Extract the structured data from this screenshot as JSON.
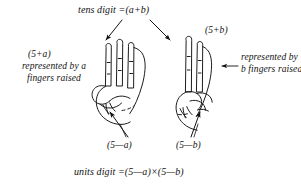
{
  "figure": {
    "background_color": "#ffffff",
    "ink_color": "#111111"
  },
  "labels": {
    "tens_digit": "tens digit =(a+b)",
    "units_digit": "units digit =(5—a)×(5—b)",
    "left_expression": "(5+a)",
    "right_expression": "(5+b)",
    "left_caption": "represented by a fingers raised",
    "right_caption": "represented by b fingers raised",
    "left_sub": "(5—a)",
    "right_sub": "(5—b)"
  },
  "annotations": {
    "arrow_down_left": "arrow-to-left-hand-raised-fingers",
    "arrow_down_right": "arrow-to-right-hand-raised-fingers",
    "arrow_left_pointing": "arrow-to-right-hand-raised-fingers-from-caption",
    "arrow_up_left": "arrow-to-left-hand-folded-fingers",
    "arrow_up_right": "arrow-to-right-hand-folded-fingers",
    "leader_left": "leader-line-left-folded-fingers",
    "leader_right": "leader-line-right-folded-fingers"
  },
  "hands": {
    "left": {
      "name": "left-hand-drawing",
      "raised_fingers": 3,
      "folded_fingers": 2
    },
    "right": {
      "name": "right-hand-drawing",
      "raised_fingers": 2,
      "folded_fingers": 3
    }
  }
}
